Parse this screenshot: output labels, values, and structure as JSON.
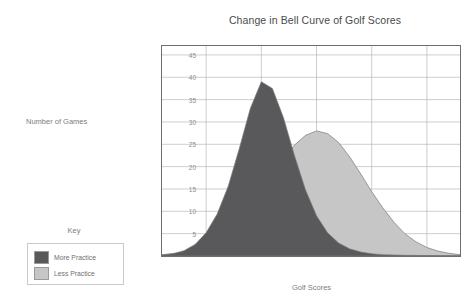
{
  "chart_data": {
    "type": "area",
    "title": "Change in Bell Curve of Golf Scores",
    "xlabel": "Golf Scores",
    "ylabel": "Number of Games",
    "xlim": [
      76,
      103
    ],
    "ylim": [
      0,
      47
    ],
    "xticks": [
      80,
      85,
      90,
      95,
      100
    ],
    "yticks": [
      5,
      10,
      15,
      20,
      25,
      30,
      35,
      40,
      45
    ],
    "grid": true,
    "legend_title": "Key",
    "legend_position": "outside-left",
    "series": [
      {
        "name": "More Practice",
        "color": "#59595b",
        "mean": 85,
        "sigma": 2.6,
        "peak": 39,
        "points": [
          {
            "x": 76,
            "y": 0.2
          },
          {
            "x": 77,
            "y": 0.5
          },
          {
            "x": 78,
            "y": 1.2
          },
          {
            "x": 79,
            "y": 2.6
          },
          {
            "x": 80,
            "y": 5.2
          },
          {
            "x": 81,
            "y": 9.4
          },
          {
            "x": 82,
            "y": 15.6
          },
          {
            "x": 83,
            "y": 24.0
          },
          {
            "x": 84,
            "y": 33.0
          },
          {
            "x": 85,
            "y": 39.0
          },
          {
            "x": 86,
            "y": 37.5
          },
          {
            "x": 87,
            "y": 31.0
          },
          {
            "x": 88,
            "y": 22.5
          },
          {
            "x": 89,
            "y": 14.8
          },
          {
            "x": 90,
            "y": 9.0
          },
          {
            "x": 91,
            "y": 5.2
          },
          {
            "x": 92,
            "y": 2.9
          },
          {
            "x": 93,
            "y": 1.6
          },
          {
            "x": 94,
            "y": 0.9
          },
          {
            "x": 95,
            "y": 0.5
          },
          {
            "x": 96,
            "y": 0.3
          },
          {
            "x": 98,
            "y": 0.15
          },
          {
            "x": 100,
            "y": 0.1
          },
          {
            "x": 103,
            "y": 0.05
          }
        ]
      },
      {
        "name": "Less Practice",
        "color": "#c6c6c6",
        "mean": 90,
        "sigma": 3.7,
        "peak": 28,
        "points": [
          {
            "x": 76,
            "y": 0.3
          },
          {
            "x": 78,
            "y": 0.8
          },
          {
            "x": 79,
            "y": 1.4
          },
          {
            "x": 80,
            "y": 2.3
          },
          {
            "x": 81,
            "y": 3.6
          },
          {
            "x": 82,
            "y": 5.4
          },
          {
            "x": 83,
            "y": 7.8
          },
          {
            "x": 84,
            "y": 10.8
          },
          {
            "x": 85,
            "y": 14.3
          },
          {
            "x": 86,
            "y": 18.0
          },
          {
            "x": 87,
            "y": 21.6
          },
          {
            "x": 88,
            "y": 24.8
          },
          {
            "x": 89,
            "y": 27.0
          },
          {
            "x": 90,
            "y": 28.0
          },
          {
            "x": 91,
            "y": 27.4
          },
          {
            "x": 92,
            "y": 25.4
          },
          {
            "x": 93,
            "y": 22.2
          },
          {
            "x": 94,
            "y": 18.4
          },
          {
            "x": 95,
            "y": 14.4
          },
          {
            "x": 96,
            "y": 10.8
          },
          {
            "x": 97,
            "y": 7.6
          },
          {
            "x": 98,
            "y": 5.0
          },
          {
            "x": 99,
            "y": 3.2
          },
          {
            "x": 100,
            "y": 1.9
          },
          {
            "x": 101,
            "y": 1.1
          },
          {
            "x": 102,
            "y": 0.6
          },
          {
            "x": 103,
            "y": 0.3
          }
        ]
      }
    ]
  }
}
